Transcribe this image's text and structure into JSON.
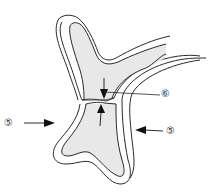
{
  "diagram": {
    "type": "cell-junction-illustration",
    "colors": {
      "fill": "#e8e8e8",
      "stroke": "#2a2a2a",
      "background": "#ffffff"
    },
    "labels": [
      {
        "id": "label-6",
        "text": "⑥",
        "x": 163,
        "y": 90,
        "points_to": "junction-gap"
      },
      {
        "id": "label-5-left",
        "text": "⑤",
        "x": 4,
        "y": 118,
        "points_to": "outer-membrane-left"
      },
      {
        "id": "label-5-right",
        "text": "⑤",
        "x": 167,
        "y": 127,
        "points_to": "outer-membrane-right"
      }
    ]
  }
}
